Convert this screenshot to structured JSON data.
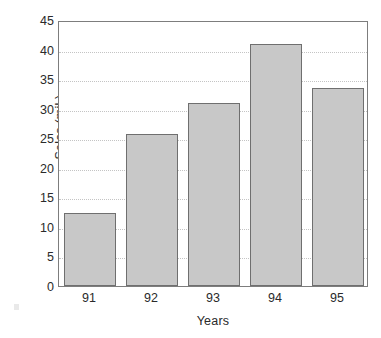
{
  "chart_data": {
    "type": "bar",
    "title": "",
    "subtitle": "",
    "xlabel": "Years",
    "ylabel": "Sales (mil.)",
    "categories": [
      "91",
      "92",
      "93",
      "94",
      "95"
    ],
    "values": [
      12.3,
      25.7,
      31.0,
      41.0,
      33.5
    ],
    "series": [
      {
        "name": "Sales",
        "values": [
          12.3,
          25.7,
          31.0,
          41.0,
          33.5
        ]
      }
    ],
    "ylim": [
      0,
      45
    ],
    "ytick_labels": [
      "0",
      "5",
      "10",
      "15",
      "20",
      "25",
      "30",
      "35",
      "40",
      "45"
    ],
    "ytick_values": [
      0,
      5,
      10,
      15,
      20,
      25,
      30,
      35,
      40,
      45
    ],
    "xtick_labels": [
      "91",
      "92",
      "93",
      "94",
      "95"
    ],
    "grid": true,
    "grid_axis": "y",
    "grid_style": "dotted",
    "legend": false,
    "legend_position": "none",
    "bar_fill_color": "#c8c8c8",
    "bar_edge_color": "#6f6f6f",
    "grid_color": "#c4c4c4",
    "axis_color": "#7d7d7d",
    "text_color": "#2a2a2a",
    "background_color": "#ffffff"
  }
}
